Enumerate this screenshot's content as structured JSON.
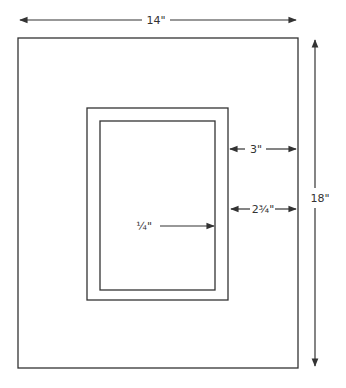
{
  "diagram": {
    "colors": {
      "line": "#333333",
      "background": "#ffffff"
    },
    "outer_frame": {
      "width_label": "14\"",
      "height_label": "18\""
    },
    "mat_border_label": "3\"",
    "opening_offset_label": "2¾\"",
    "inner_border_label": "¼\""
  }
}
